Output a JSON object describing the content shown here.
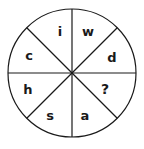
{
  "figure": {
    "type": "circle-divided-into-eight-sectors",
    "background_color": "#ffffff",
    "line_color": "#1a1a1a",
    "text_color": "#1a1a1a"
  },
  "wheel": {
    "center_x": 72,
    "center_y": 73,
    "radius": 64,
    "sector_count": 8,
    "divider_count": 4,
    "divider_angles_deg": [
      0,
      45,
      90,
      135
    ]
  },
  "sectors": [
    {
      "id": "sector-top-left",
      "label": "i",
      "position": "top-left",
      "x": 60,
      "y": 32,
      "angle_deg": 112.5,
      "is_unknown": false
    },
    {
      "id": "sector-top-right",
      "label": "w",
      "position": "top-right",
      "x": 88,
      "y": 32,
      "angle_deg": 67.5,
      "is_unknown": false
    },
    {
      "id": "sector-upper-right",
      "label": "d",
      "position": "upper-right",
      "x": 112,
      "y": 58,
      "angle_deg": 22.5,
      "is_unknown": false
    },
    {
      "id": "sector-lower-right",
      "label": "?",
      "position": "lower-right",
      "x": 105,
      "y": 89,
      "angle_deg": -22.5,
      "is_unknown": true
    },
    {
      "id": "sector-bottom-right",
      "label": "a",
      "position": "bottom-right",
      "x": 85,
      "y": 116,
      "angle_deg": -67.5,
      "is_unknown": false
    },
    {
      "id": "sector-bottom-left",
      "label": "s",
      "position": "bottom-left",
      "x": 50,
      "y": 116,
      "angle_deg": -112.5,
      "is_unknown": false
    },
    {
      "id": "sector-lower-left",
      "label": "h",
      "position": "lower-left",
      "x": 28,
      "y": 90,
      "angle_deg": -157.5,
      "is_unknown": false
    },
    {
      "id": "sector-upper-left",
      "label": "c",
      "position": "upper-left",
      "x": 29,
      "y": 56,
      "angle_deg": 157.5,
      "is_unknown": false
    }
  ]
}
